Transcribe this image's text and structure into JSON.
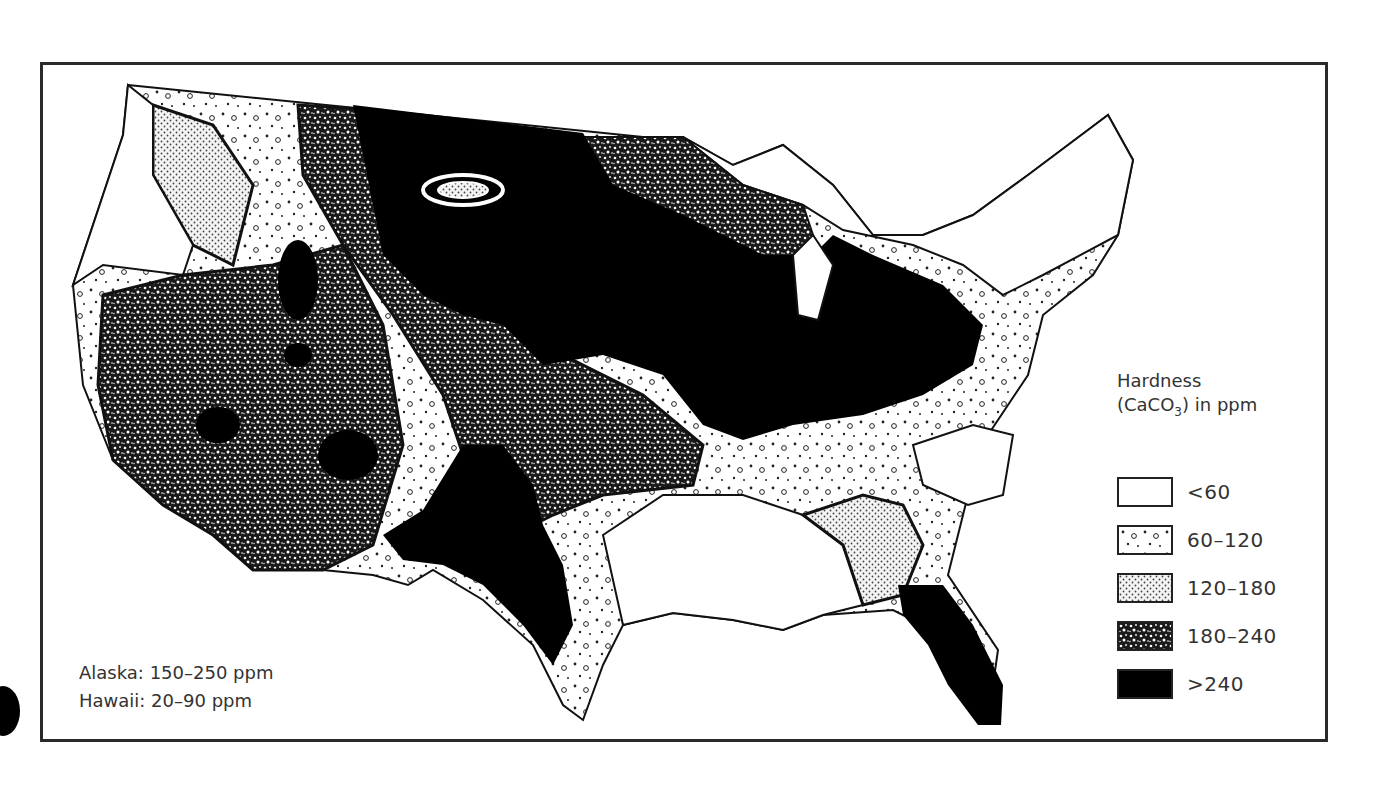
{
  "map": {
    "subject": "Water hardness across the contiguous United States",
    "region": "Contiguous United States"
  },
  "legend": {
    "title_line1": "Hardness",
    "title_prefix": "(CaCO",
    "title_sub": "3",
    "title_suffix": ") in ppm",
    "items": [
      {
        "label": "<60",
        "pattern": "white",
        "fill": "#ffffff"
      },
      {
        "label": "60–120",
        "pattern": "sparse-circles",
        "fill": "#ffffff"
      },
      {
        "label": "120–180",
        "pattern": "fine-dots",
        "fill": "#eeeeee"
      },
      {
        "label": "180–240",
        "pattern": "dense-speckle",
        "fill": "#333333"
      },
      {
        "label": ">240",
        "pattern": "solid-black",
        "fill": "#000000"
      }
    ]
  },
  "notes": {
    "alaska": "Alaska: 150–250 ppm",
    "hawaii": "Hawaii: 20–90 ppm"
  },
  "colors": {
    "frame": "#2a2a2a",
    "text": "#333333",
    "black_fill": "#000000",
    "background": "#ffffff"
  }
}
